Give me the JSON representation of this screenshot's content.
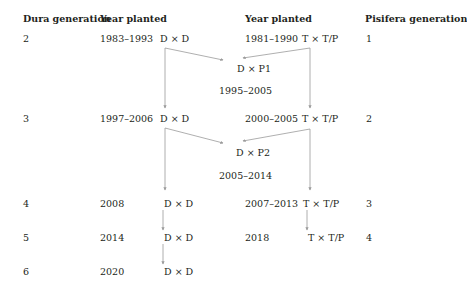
{
  "headers": {
    "dura_generation": "Dura generation",
    "year_planted_left": "Year planted",
    "year_planted_right": "Year planted",
    "pisifera_generation": "Pisifera generation"
  },
  "rows": [
    {
      "dura_gen": "2",
      "dura_year": "1983–1993",
      "dura_cross": "D × D",
      "pis_year": "1981–1990",
      "pis_cross": "T × T/P",
      "pis_gen": "1"
    },
    {
      "dura_gen": "3",
      "dura_year": "1997–2006",
      "dura_cross": "D × D",
      "pis_year": "2000–2005",
      "pis_cross": "T × T/P",
      "pis_gen": "2"
    },
    {
      "dura_gen": "4",
      "dura_year": "2008",
      "dura_cross": "D × D",
      "pis_year": "2007–2013",
      "pis_cross": "T × T/P",
      "pis_gen": "3"
    },
    {
      "dura_gen": "5",
      "dura_year": "2014",
      "dura_cross": "D × D",
      "pis_year": "2018",
      "pis_cross": "T × T/P",
      "pis_gen": "4"
    },
    {
      "dura_gen": "6",
      "dura_year": "2020",
      "dura_cross": "D × D"
    }
  ],
  "hybrids": [
    {
      "label": "D × P1",
      "years": "1995–2005"
    },
    {
      "label": "D × P2",
      "years": "2005–2014"
    }
  ],
  "colors": {
    "text": "#231f20",
    "arrow": "#9a9a9a"
  }
}
